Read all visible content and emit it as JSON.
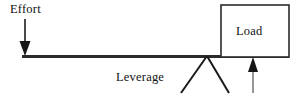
{
  "diagram": {
    "type": "lever-mechanical-advantage-diagram",
    "background_color": "#ffffff",
    "stroke_color": "#1a1a1a",
    "labels": {
      "effort": "Effort",
      "load": "Load",
      "leverage": "Leverage"
    },
    "elements": {
      "lever_beam": {
        "name": "lever-beam",
        "x1": 22,
        "y1": 56.5,
        "x2": 289,
        "y2": 56.5,
        "thickness": 3
      },
      "effort_arrow": {
        "name": "effort-arrow",
        "direction": "down",
        "shaft_x": 25,
        "shaft_top_y": 19,
        "head_tip_y": 56,
        "head_width": 11,
        "head_height": 14
      },
      "load_box": {
        "name": "load-box",
        "x": 221,
        "y": 5,
        "width": 68,
        "height": 52,
        "border_width": 1.5
      },
      "fulcrum": {
        "name": "fulcrum-triangle",
        "apex_x": 207,
        "apex_y": 56,
        "left_x": 181,
        "left_y": 93,
        "right_x": 229,
        "right_y": 93
      },
      "reaction_arrow": {
        "name": "reaction-force-arrow",
        "direction": "up",
        "shaft_x": 253,
        "shaft_bottom_y": 93,
        "head_tip_y": 57,
        "head_width": 10,
        "head_height": 14
      }
    }
  }
}
